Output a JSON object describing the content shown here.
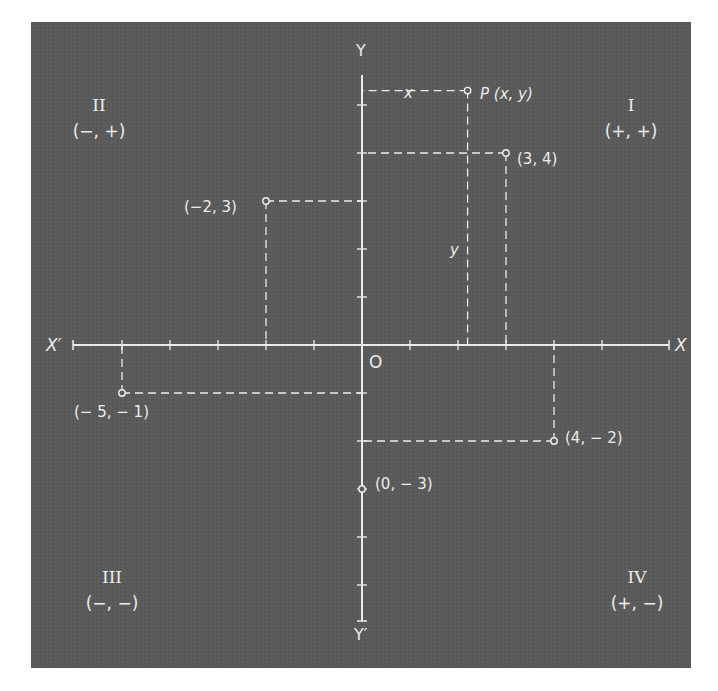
{
  "figure": {
    "axes": {
      "x_positive_label": "X",
      "x_negative_label": "X′",
      "y_positive_label": "Y",
      "y_negative_label": "Y′",
      "origin_label": "O"
    },
    "quadrants": [
      {
        "numeral": "I",
        "signs": "(+, +)"
      },
      {
        "numeral": "II",
        "signs": "(−, +)"
      },
      {
        "numeral": "III",
        "signs": "(−, −)"
      },
      {
        "numeral": "IV",
        "signs": "(+, −)"
      }
    ],
    "points": [
      {
        "label": "(3, 4)",
        "x": 3,
        "y": 4
      },
      {
        "label": "(−2, 3)",
        "x": -2,
        "y": 3
      },
      {
        "label": "(− 5, − 1)",
        "x": -5,
        "y": -1
      },
      {
        "label": "(4, − 2)",
        "x": 4,
        "y": -2
      },
      {
        "label": "(0, − 3)",
        "x": 0,
        "y": -3
      }
    ],
    "general_point": {
      "label": "P (x, y)",
      "x_label": "x",
      "y_label": "y"
    }
  },
  "chart_data": {
    "type": "scatter",
    "title": "",
    "xlabel": "X",
    "ylabel": "Y",
    "xlim": [
      -6,
      6
    ],
    "ylim": [
      -6,
      6
    ],
    "grid": false,
    "tick_interval": 1,
    "x_ticks": [
      -5,
      -4,
      -3,
      -2,
      -1,
      1,
      2,
      3,
      4,
      5
    ],
    "y_ticks": [
      -5,
      -4,
      -3,
      -2,
      -1,
      1,
      2,
      3,
      4,
      5
    ],
    "series": [
      {
        "name": "plotted points",
        "points": [
          {
            "x": 3,
            "y": 4,
            "label": "(3, 4)"
          },
          {
            "x": -2,
            "y": 3,
            "label": "(−2, 3)"
          },
          {
            "x": -5,
            "y": -1,
            "label": "(− 5, − 1)"
          },
          {
            "x": 4,
            "y": -2,
            "label": "(4, − 2)"
          },
          {
            "x": 0,
            "y": -3,
            "label": "(0, − 3)"
          }
        ]
      },
      {
        "name": "general point",
        "points": [
          {
            "x": 2.2,
            "y": 5.3,
            "label": "P (x, y)"
          }
        ]
      }
    ],
    "annotations": [
      "Quadrant I (+, +)",
      "Quadrant II (−, +)",
      "Quadrant III (−, −)",
      "Quadrant IV (+, −)",
      "Origin O",
      "Axis ends X, X′, Y, Y′",
      "Dashed projection lines from each point to the axes"
    ]
  },
  "style": {
    "panel_color": "#5b5b5b",
    "ink_color": "#ececec"
  }
}
